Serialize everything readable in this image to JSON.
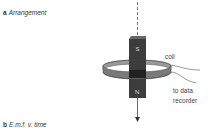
{
  "panel_a": {
    "letter": "a",
    "title": "Arrangement"
  },
  "panel_b": {
    "letter": "b",
    "title": "E.m.f. v. time"
  },
  "diagram": {
    "magnet": {
      "top_pole": "S",
      "bottom_pole": "N",
      "color": "#3a3a3a"
    },
    "coil": {
      "label": "coil",
      "color": "#6e6e6e"
    },
    "wires": {
      "label_line1": "to data",
      "label_line2": "recorder"
    },
    "motion_arrow": {
      "direction": "down"
    }
  }
}
